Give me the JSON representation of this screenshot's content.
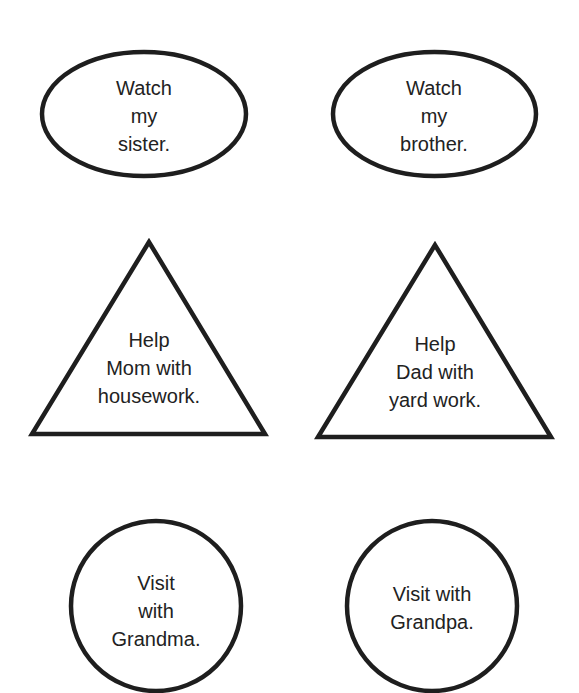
{
  "colors": {
    "stroke": "#1e1e1e",
    "text": "#222222",
    "background": "#ffffff"
  },
  "shapes": [
    {
      "id": "watch-sister",
      "shape": "oval",
      "lines": [
        "Watch",
        "my",
        "sister."
      ]
    },
    {
      "id": "watch-brother",
      "shape": "oval",
      "lines": [
        "Watch",
        "my",
        "brother."
      ]
    },
    {
      "id": "help-mom",
      "shape": "triangle",
      "lines": [
        "Help",
        "Mom with",
        "housework."
      ]
    },
    {
      "id": "help-dad",
      "shape": "triangle",
      "lines": [
        "Help",
        "Dad with",
        "yard work."
      ]
    },
    {
      "id": "visit-grandma",
      "shape": "circle",
      "lines": [
        "Visit",
        "with",
        "Grandma."
      ]
    },
    {
      "id": "visit-grandpa",
      "shape": "circle",
      "lines": [
        "Visit with",
        "Grandpa."
      ]
    }
  ]
}
